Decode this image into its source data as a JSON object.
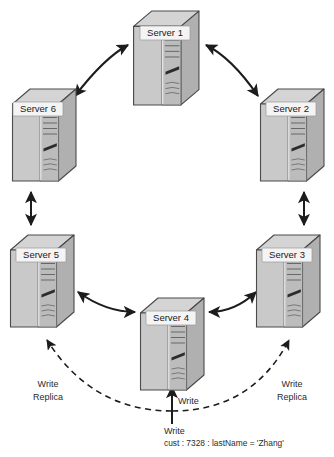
{
  "diagram": {
    "type": "network-ring-diagram",
    "colors": {
      "background": "#ffffff",
      "server_top_face": "#d2d2d2",
      "server_left_face": "#c6c6c6",
      "server_front_face": "#bdbdbd",
      "server_panel": "#b3b3b3",
      "server_outline": "#4a4a4a",
      "label_box_fill": "#f4f4f4",
      "label_text": "#1a1a1a",
      "arrow": "#1c1c1c",
      "dashed_arrow": "#1c1c1c",
      "annotation_text": "#2b2b2b"
    },
    "servers": [
      {
        "id": "server-1",
        "label": "Server 1",
        "x": 131,
        "y": 8,
        "w": 70,
        "h": 100
      },
      {
        "id": "server-2",
        "label": "Server 2",
        "x": 258,
        "y": 86,
        "w": 68,
        "h": 98
      },
      {
        "id": "server-3",
        "label": "Server 3",
        "x": 254,
        "y": 232,
        "w": 68,
        "h": 98
      },
      {
        "id": "server-4",
        "label": "Server 4",
        "x": 138,
        "y": 295,
        "w": 68,
        "h": 98
      },
      {
        "id": "server-5",
        "label": "Server 5",
        "x": 8,
        "y": 232,
        "w": 68,
        "h": 98
      },
      {
        "id": "server-6",
        "label": "Server 6",
        "x": 10,
        "y": 86,
        "w": 68,
        "h": 98
      }
    ],
    "ring_links": [
      {
        "id": "link-6-1",
        "from": "Server 6",
        "to": "Server 1",
        "style": "solid",
        "arrows": "double"
      },
      {
        "id": "link-1-2",
        "from": "Server 1",
        "to": "Server 2",
        "style": "solid",
        "arrows": "double"
      },
      {
        "id": "link-2-3",
        "from": "Server 2",
        "to": "Server 3",
        "style": "solid",
        "arrows": "double"
      },
      {
        "id": "link-3-4",
        "from": "Server 3",
        "to": "Server 4",
        "style": "solid",
        "arrows": "double"
      },
      {
        "id": "link-4-5",
        "from": "Server 4",
        "to": "Server 5",
        "style": "solid",
        "arrows": "double"
      },
      {
        "id": "link-5-6",
        "from": "Server 5",
        "to": "Server 6",
        "style": "solid",
        "arrows": "double"
      }
    ],
    "annotations": {
      "write_left_line1": "Write",
      "write_left_line2": "Replica",
      "write_right_line1": "Write",
      "write_right_line2": "Replica",
      "write_center": "Write",
      "origin_label": "Write",
      "origin_payload": "cust : 7328 : lastName = 'Zhang'"
    },
    "replica_links": [
      {
        "id": "replica-left",
        "to": "Server 5",
        "style": "dashed",
        "label": "Write Replica"
      },
      {
        "id": "replica-right",
        "to": "Server 3",
        "style": "dashed",
        "label": "Write Replica"
      }
    ],
    "write_link": {
      "id": "write-to-server4",
      "to": "Server 4",
      "style": "solid",
      "label": "Write"
    }
  }
}
